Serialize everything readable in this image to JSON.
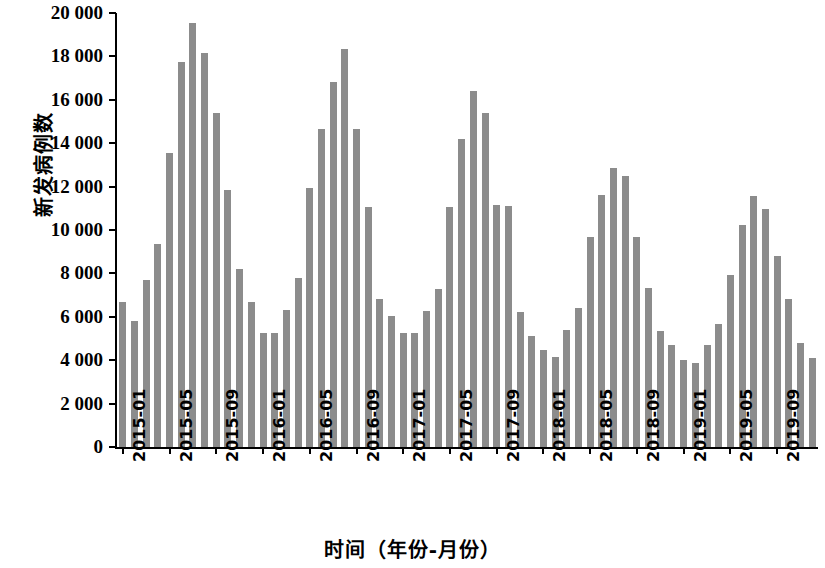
{
  "chart_data": {
    "type": "bar",
    "title": "",
    "xlabel": "时间（年份-月份）",
    "ylabel": "新发病例数",
    "ylim": [
      0,
      20000
    ],
    "ytick_step": 2000,
    "ytick_labels": [
      "0",
      "2 000",
      "4 000",
      "6 000",
      "8 000",
      "10 000",
      "12 000",
      "14 000",
      "16 000",
      "18 000",
      "20 000"
    ],
    "ytick_values": [
      0,
      2000,
      4000,
      6000,
      8000,
      10000,
      12000,
      14000,
      16000,
      18000,
      20000
    ],
    "grid": false,
    "legend": null,
    "bar_color": "#8c8c8c",
    "axis_color": "#000000",
    "xtick_labels": [
      "2015-01",
      "2015-05",
      "2015-09",
      "2016-01",
      "2016-05",
      "2016-09",
      "2017-01",
      "2017-05",
      "2017-09",
      "2018-01",
      "2018-05",
      "2018-09",
      "2019-01",
      "2019-05",
      "2019-09"
    ],
    "xtick_indices": [
      0,
      4,
      8,
      12,
      16,
      20,
      24,
      28,
      32,
      36,
      40,
      44,
      48,
      52,
      56
    ],
    "categories": [
      "2015-01",
      "2015-02",
      "2015-03",
      "2015-04",
      "2015-05",
      "2015-06",
      "2015-07",
      "2015-08",
      "2015-09",
      "2015-10",
      "2015-11",
      "2015-12",
      "2016-01",
      "2016-02",
      "2016-03",
      "2016-04",
      "2016-05",
      "2016-06",
      "2016-07",
      "2016-08",
      "2016-09",
      "2016-10",
      "2016-11",
      "2016-12",
      "2017-01",
      "2017-02",
      "2017-03",
      "2017-04",
      "2017-05",
      "2017-06",
      "2017-07",
      "2017-08",
      "2017-09",
      "2017-10",
      "2017-11",
      "2017-12",
      "2018-01",
      "2018-02",
      "2018-03",
      "2018-04",
      "2018-05",
      "2018-06",
      "2018-07",
      "2018-08",
      "2018-09",
      "2018-10",
      "2018-11",
      "2018-12",
      "2019-01",
      "2019-02",
      "2019-03",
      "2019-04",
      "2019-05",
      "2019-06",
      "2019-07",
      "2019-08",
      "2019-09",
      "2019-10",
      "2019-11",
      "2019-12"
    ],
    "values": [
      6700,
      5800,
      7700,
      9350,
      13550,
      17750,
      19550,
      18150,
      15400,
      11850,
      8200,
      6700,
      5250,
      5250,
      6300,
      7800,
      11950,
      14650,
      16800,
      18350,
      14650,
      11050,
      6800,
      6050,
      5250,
      5250,
      6250,
      7300,
      11050,
      14200,
      16400,
      15400,
      11150,
      11100,
      6200,
      5100,
      4450,
      4150,
      5400,
      6400,
      9700,
      11600,
      12850,
      12500,
      9700,
      7350,
      5350,
      4700,
      4000,
      3850,
      4700,
      5650,
      7950,
      10250,
      11550,
      10950,
      8800,
      6800,
      4800,
      4100
    ]
  }
}
